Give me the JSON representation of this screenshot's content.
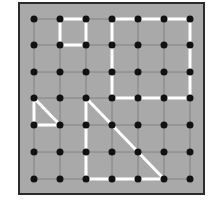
{
  "diagram": {
    "type": "geoboard",
    "grid": {
      "cols": 7,
      "rows": 7,
      "x": [
        34,
        60,
        86,
        112,
        138,
        164,
        190
      ],
      "y": [
        19,
        45,
        72,
        98,
        125,
        152,
        179
      ]
    },
    "colors": {
      "board": "#a9a9a9",
      "frame": "#2b2b2b",
      "peg": "#111111",
      "gridline": "#7a7a7a",
      "band": "#ffffff"
    },
    "shapes": [
      {
        "name": "small-square",
        "points": [
          [
            1,
            0
          ],
          [
            2,
            0
          ],
          [
            2,
            1
          ],
          [
            1,
            1
          ]
        ]
      },
      {
        "name": "large-square",
        "points": [
          [
            3,
            0
          ],
          [
            6,
            0
          ],
          [
            6,
            3
          ],
          [
            3,
            3
          ]
        ]
      },
      {
        "name": "small-triangle",
        "points": [
          [
            0,
            3
          ],
          [
            1,
            4
          ],
          [
            0,
            4
          ]
        ]
      },
      {
        "name": "large-triangle",
        "points": [
          [
            2,
            3
          ],
          [
            5,
            6
          ],
          [
            2,
            6
          ]
        ]
      }
    ]
  },
  "caption": ""
}
